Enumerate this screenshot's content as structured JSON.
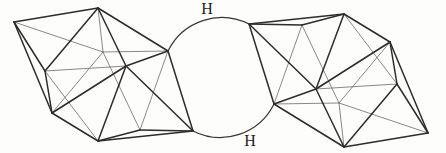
{
  "figure": {
    "background": "#fdfdfc",
    "stroke_front_color": "#2e2c2a",
    "stroke_back_color": "#6e6a66",
    "labels": [
      {
        "name": "bridge-hydrogen-top-label",
        "text": "H",
        "x": 207,
        "y": 13.5
      },
      {
        "name": "bridge-hydrogen-bottom-label",
        "text": "H",
        "x": 250,
        "y": 146
      }
    ],
    "bridge": {
      "radius": 60,
      "arcs": [
        {
          "name": "bridge-arc-top",
          "from": [
            168,
            51
          ],
          "to": [
            249,
            24
          ],
          "large": 0,
          "sweep": 1
        },
        {
          "name": "bridge-arc-bottom",
          "from": [
            193,
            131
          ],
          "to": [
            274,
            104
          ],
          "large": 0,
          "sweep": 0
        }
      ]
    },
    "clusters": [
      {
        "name": "left-icosahedron-cluster",
        "vertices": {
          "v0": [
            98,
            8
          ],
          "v1": [
            14,
            22
          ],
          "v2": [
            45,
            71
          ],
          "v3": [
            52,
            113
          ],
          "v4": [
            98,
            141
          ],
          "v5": [
            168,
            51
          ],
          "v6": [
            126,
            66
          ],
          "v7": [
            193,
            131
          ],
          "v8": [
            103,
            52
          ],
          "v9": [
            140,
            130
          ]
        },
        "edges_front": [
          [
            "v0",
            "v1"
          ],
          [
            "v0",
            "v2"
          ],
          [
            "v0",
            "v5"
          ],
          [
            "v0",
            "v6"
          ],
          [
            "v1",
            "v2"
          ],
          [
            "v1",
            "v3"
          ],
          [
            "v2",
            "v3"
          ],
          [
            "v3",
            "v4"
          ],
          [
            "v3",
            "v6"
          ],
          [
            "v4",
            "v6"
          ],
          [
            "v4",
            "v7"
          ],
          [
            "v4",
            "v9"
          ],
          [
            "v5",
            "v6"
          ],
          [
            "v5",
            "v7"
          ],
          [
            "v6",
            "v7"
          ],
          [
            "v9",
            "v7"
          ]
        ],
        "edges_back": [
          [
            "v0",
            "v8"
          ],
          [
            "v1",
            "v8"
          ],
          [
            "v3",
            "v8"
          ],
          [
            "v5",
            "v8"
          ],
          [
            "v9",
            "v8"
          ],
          [
            "v2",
            "v6"
          ],
          [
            "v2",
            "v4"
          ],
          [
            "v5",
            "v9"
          ]
        ]
      },
      {
        "name": "right-icosahedron-cluster",
        "vertices": {
          "v0": [
            344,
            147
          ],
          "v1": [
            428,
            133
          ],
          "v2": [
            397,
            84
          ],
          "v3": [
            390,
            42
          ],
          "v4": [
            344,
            14
          ],
          "v5": [
            274,
            104
          ],
          "v6": [
            316,
            89
          ],
          "v7": [
            249,
            24
          ],
          "v8": [
            339,
            103
          ],
          "v9": [
            302,
            25
          ]
        },
        "edges_front": [
          [
            "v0",
            "v1"
          ],
          [
            "v0",
            "v2"
          ],
          [
            "v0",
            "v5"
          ],
          [
            "v0",
            "v6"
          ],
          [
            "v1",
            "v2"
          ],
          [
            "v1",
            "v3"
          ],
          [
            "v2",
            "v3"
          ],
          [
            "v3",
            "v4"
          ],
          [
            "v3",
            "v6"
          ],
          [
            "v4",
            "v6"
          ],
          [
            "v4",
            "v7"
          ],
          [
            "v4",
            "v9"
          ],
          [
            "v5",
            "v6"
          ],
          [
            "v5",
            "v7"
          ],
          [
            "v6",
            "v7"
          ],
          [
            "v9",
            "v7"
          ]
        ],
        "edges_back": [
          [
            "v0",
            "v8"
          ],
          [
            "v1",
            "v8"
          ],
          [
            "v3",
            "v8"
          ],
          [
            "v5",
            "v8"
          ],
          [
            "v9",
            "v8"
          ],
          [
            "v2",
            "v6"
          ],
          [
            "v2",
            "v4"
          ],
          [
            "v5",
            "v9"
          ]
        ]
      }
    ]
  }
}
